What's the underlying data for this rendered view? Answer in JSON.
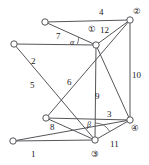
{
  "figure": {
    "kind": "graph-diagram",
    "width": 149,
    "height": 165,
    "background": "#ffffff",
    "line_color": "#55555a",
    "node_fill": "#ffffff",
    "node_stroke": "#55555a",
    "label_color": "#1a1a1a"
  },
  "nodes": [
    {
      "id": "A",
      "x": 45,
      "y": 22,
      "r": 3.2
    },
    {
      "id": "B",
      "x": 14,
      "y": 44,
      "r": 3.2
    },
    {
      "id": "C",
      "x": 96,
      "y": 45,
      "r": 3.2
    },
    {
      "id": "D",
      "x": 130,
      "y": 20,
      "r": 3.2
    },
    {
      "id": "E",
      "x": 46,
      "y": 118,
      "r": 3.2
    },
    {
      "id": "F",
      "x": 13,
      "y": 141,
      "r": 3.2
    },
    {
      "id": "G",
      "x": 95,
      "y": 140,
      "r": 3.2
    },
    {
      "id": "H",
      "x": 130,
      "y": 120,
      "r": 3.2
    }
  ],
  "edges": [
    {
      "from": "A",
      "to": "D",
      "label": "4"
    },
    {
      "from": "A",
      "to": "C",
      "label": "7"
    },
    {
      "from": "C",
      "to": "D",
      "label": "12"
    },
    {
      "from": "B",
      "to": "C",
      "label": "2"
    },
    {
      "from": "B",
      "to": "G",
      "label": "5"
    },
    {
      "from": "E",
      "to": "D",
      "label": "6"
    },
    {
      "from": "D",
      "to": "H",
      "label": "10"
    },
    {
      "from": "C",
      "to": "G",
      "label": "9"
    },
    {
      "from": "E",
      "to": "H",
      "label": "3"
    },
    {
      "from": "E",
      "to": "G",
      "label": "8"
    },
    {
      "from": "G",
      "to": "H",
      "label": "11"
    },
    {
      "from": "F",
      "to": "H",
      "label": "1"
    },
    {
      "from": "F",
      "to": "G",
      "label": ""
    },
    {
      "from": "C",
      "to": "H",
      "label": ""
    }
  ],
  "edge_labels": [
    {
      "text": "4",
      "x": 99,
      "y": 8
    },
    {
      "text": "7",
      "x": 56,
      "y": 32
    },
    {
      "text": "12",
      "x": 100,
      "y": 26
    },
    {
      "text": "2",
      "x": 31,
      "y": 57
    },
    {
      "text": "5",
      "x": 30,
      "y": 81
    },
    {
      "text": "6",
      "x": 67,
      "y": 78
    },
    {
      "text": "10",
      "x": 132,
      "y": 71
    },
    {
      "text": "9",
      "x": 95,
      "y": 92
    },
    {
      "text": "3",
      "x": 107,
      "y": 110
    },
    {
      "text": "8",
      "x": 50,
      "y": 123
    },
    {
      "text": "11",
      "x": 110,
      "y": 140
    },
    {
      "text": "1",
      "x": 31,
      "y": 150
    }
  ],
  "angle_labels": [
    {
      "name": "alpha",
      "text": "α",
      "x": 70,
      "y": 39
    },
    {
      "name": "beta",
      "text": "β",
      "x": 87,
      "y": 121
    }
  ],
  "node_labels": [
    {
      "name": "circled-1",
      "text": "①",
      "x": 88,
      "y": 25
    },
    {
      "name": "circled-2",
      "text": "②",
      "x": 133,
      "y": 7
    },
    {
      "name": "circled-3",
      "text": "③",
      "x": 91,
      "y": 150
    },
    {
      "name": "circled-4",
      "text": "④",
      "x": 131,
      "y": 124
    }
  ]
}
